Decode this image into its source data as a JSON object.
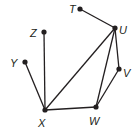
{
  "diagram": {
    "type": "graph",
    "color": "#231f20",
    "vertices": [
      {
        "id": "T",
        "label": "T",
        "x": 80,
        "y": 9,
        "lx": 69,
        "ly": 13
      },
      {
        "id": "U",
        "label": "U",
        "x": 115,
        "y": 28,
        "lx": 119,
        "ly": 34
      },
      {
        "id": "V",
        "label": "V",
        "x": 119,
        "y": 69,
        "lx": 123,
        "ly": 77
      },
      {
        "id": "W",
        "label": "W",
        "x": 96,
        "y": 107,
        "lx": 89,
        "ly": 125
      },
      {
        "id": "X",
        "label": "X",
        "x": 45,
        "y": 110,
        "lx": 38,
        "ly": 127
      },
      {
        "id": "Y",
        "label": "Y",
        "x": 25,
        "y": 62,
        "lx": 10,
        "ly": 67
      },
      {
        "id": "Z",
        "label": "Z",
        "x": 44,
        "y": 32,
        "lx": 30,
        "ly": 37
      }
    ],
    "edges": [
      [
        "T",
        "U"
      ],
      [
        "U",
        "X"
      ],
      [
        "U",
        "W"
      ],
      [
        "U",
        "V"
      ],
      [
        "V",
        "W"
      ],
      [
        "W",
        "X"
      ],
      [
        "X",
        "Y"
      ],
      [
        "X",
        "Z"
      ]
    ]
  }
}
